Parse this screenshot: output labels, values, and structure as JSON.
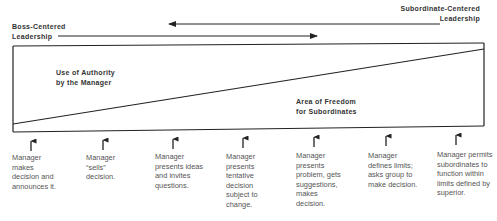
{
  "diagram": {
    "title_left": {
      "line1": "Boss-Centered",
      "line2": "Leadership"
    },
    "title_right": {
      "line1": "Subordinate-Centered",
      "line2": "Leadership"
    },
    "areas": {
      "authority": {
        "line1": "Use of Authority",
        "line2": "by the Manager"
      },
      "freedom": {
        "line1": "Area of Freedom",
        "line2": "for Subordinates"
      }
    },
    "behaviors": [
      {
        "text": "Manager makes decision and announces it."
      },
      {
        "text": "Manager “sells” decision."
      },
      {
        "text": "Manager presents ideas and invites questions."
      },
      {
        "text": "Manager presents tentative decision subject to change."
      },
      {
        "text": "Manager presents problem, gets suggestions, makes decision."
      },
      {
        "text": "Manager defines limits; asks group to make decision."
      },
      {
        "text": "Manager permits subordinates to function within limits defined by superior."
      }
    ],
    "colors": {
      "line": "#222222",
      "text_bold": "#333333",
      "text_body": "#555555",
      "background": "#ffffff"
    }
  }
}
